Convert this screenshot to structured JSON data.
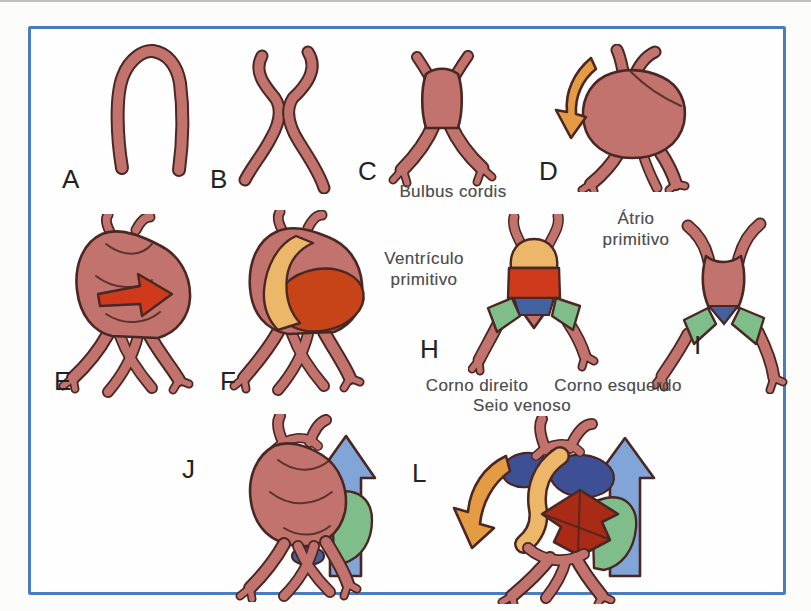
{
  "figure": {
    "panels": [
      {
        "letter": "A"
      },
      {
        "letter": "B"
      },
      {
        "letter": "C"
      },
      {
        "letter": "D"
      },
      {
        "letter": "E"
      },
      {
        "letter": "F"
      },
      {
        "letter": "H"
      },
      {
        "letter": "I"
      },
      {
        "letter": "J"
      },
      {
        "letter": "L"
      }
    ],
    "annotations": {
      "bulbus_cordis": "Bulbus cordis",
      "ventriculo_primitivo": "Ventrículo\nprimitivo",
      "atrio_primitivo": "Átrio\nprimitivo",
      "corno_direito": "Corno direito",
      "corno_esquerdo": "Corno esquerdo",
      "seio_venoso": "Seio venoso"
    },
    "colors": {
      "heart": "#c2736d",
      "outline": "#4a2723",
      "bulbus_yellow": "#ecb768",
      "ventricle_red": "#d03a1c",
      "ventricle_orange_red": "#c64418",
      "arrow_dark_red": "#a92b15",
      "atrium_blue": "#44619f",
      "atrium_navy": "#3d5096",
      "sinus_green": "#7fbd8b",
      "arrow_orange": "#e59a44",
      "arrow_blue": "#82a5d8",
      "border_blue": "#4b7cbd",
      "label_gray": "#4f4f4f",
      "letter_black": "#222222"
    }
  }
}
